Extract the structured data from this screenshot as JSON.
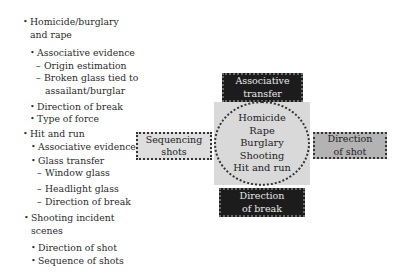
{
  "left_list": {
    "items": [
      {
        "type": "bullet",
        "level": 1,
        "lines": [
          "Homicide/burglary",
          "and rape"
        ]
      },
      {
        "type": "bullet",
        "level": 2,
        "lines": [
          "Associative evidence"
        ]
      },
      {
        "type": "dash",
        "level": 3,
        "lines": [
          "Origin estimation"
        ]
      },
      {
        "type": "dash",
        "level": 3,
        "lines": [
          "Broken glass tied to",
          "assailant/burglar"
        ]
      },
      {
        "type": "bullet",
        "level": 2,
        "lines": [
          "Direction of break"
        ]
      },
      {
        "type": "bullet",
        "level": 2,
        "lines": [
          "Type of force"
        ]
      },
      {
        "type": "bullet",
        "level": 1,
        "lines": [
          "Hit and run"
        ]
      },
      {
        "type": "bullet",
        "level": 2,
        "lines": [
          "Associative evidence"
        ]
      },
      {
        "type": "bullet",
        "level": 2,
        "lines": [
          "Glass transfer"
        ]
      },
      {
        "type": "dash",
        "level": 3,
        "lines": [
          "Window glass"
        ]
      },
      {
        "type": "dash",
        "level": 3,
        "lines": [
          "Headlight glass"
        ]
      },
      {
        "type": "dash",
        "level": 3,
        "lines": [
          "Direction of break"
        ]
      },
      {
        "type": "bullet",
        "level": 1,
        "lines": [
          "Shooting incident",
          "scenes"
        ]
      },
      {
        "type": "bullet",
        "level": 2,
        "lines": [
          "Direction of shot"
        ]
      },
      {
        "type": "bullet",
        "level": 2,
        "lines": [
          "Sequence of shots"
        ]
      }
    ]
  },
  "diagram": {
    "center": {
      "lines": [
        "Homicide",
        "Rape",
        "Burglary",
        "Shooting",
        "Hit and run"
      ],
      "square_color": "#d9d9d9"
    },
    "top": {
      "lines": [
        "Associative",
        "transfer"
      ],
      "fill": "#1c1c1c"
    },
    "left": {
      "lines": [
        "Sequencing",
        "shots"
      ],
      "fill": "#dedede"
    },
    "right": {
      "lines": [
        "Direction",
        "of shot"
      ],
      "fill": "#b3b3b3"
    },
    "bottom": {
      "lines": [
        "Direction",
        "of break"
      ],
      "fill": "#1c1c1c"
    }
  }
}
